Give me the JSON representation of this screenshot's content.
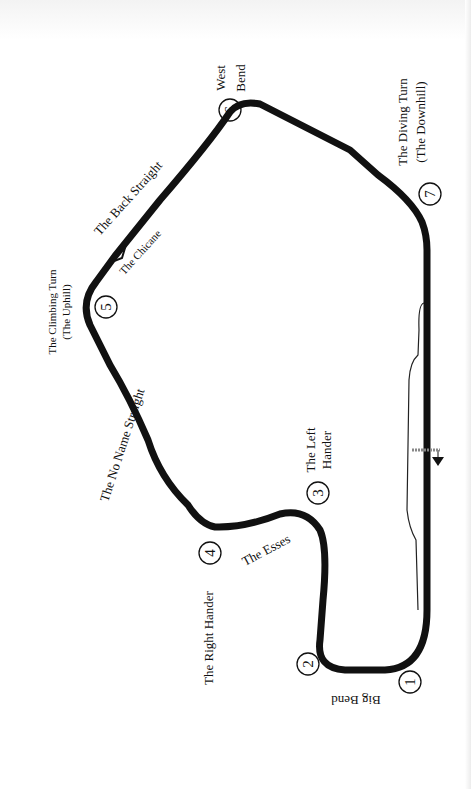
{
  "map": {
    "title": "Race circuit map",
    "orientation": "rotated 90 degrees counter-clockwise",
    "colors": {
      "track": "#111111",
      "background": "#ffffff",
      "start_line": "#888888"
    },
    "turns": [
      {
        "number": "1",
        "name": "Big Bend"
      },
      {
        "number": "2",
        "name": ""
      },
      {
        "number": "3",
        "name_line1": "The Left",
        "name_line2": "Hander"
      },
      {
        "number": "4",
        "name": "The Right Hander"
      },
      {
        "number": "5",
        "name_line1": "The Climbing Turn",
        "name_line2": "(The Uphill)"
      },
      {
        "number": "6",
        "name_line1": "West",
        "name_line2": "Bend"
      },
      {
        "number": "7",
        "name_line1": "The Diving Turn",
        "name_line2": "(The Downhill)"
      }
    ],
    "sections": {
      "back_straight": "The Back Straight",
      "chicane": "The Chicane",
      "no_name_straight": "The No Name Straight",
      "esses": "The Esses"
    },
    "start_finish": {
      "icon": "arrow-down-icon",
      "direction": "down"
    }
  }
}
